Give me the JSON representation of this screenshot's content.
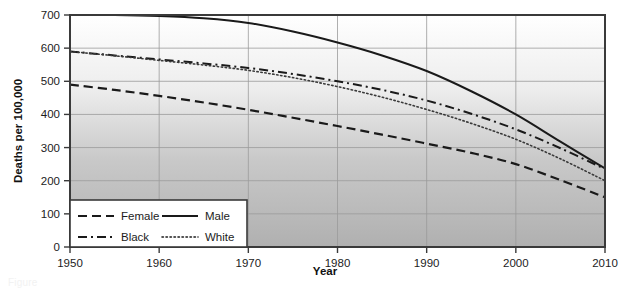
{
  "figure": {
    "caption_fragment": "Figure"
  },
  "axes": {
    "x_title": "Year",
    "y_title": "Deaths per 100,000",
    "x_ticks": [
      "1950",
      "1960",
      "1970",
      "1980",
      "1990",
      "2000",
      "2010"
    ],
    "y_ticks": [
      "0",
      "100",
      "200",
      "300",
      "400",
      "500",
      "600",
      "700"
    ]
  },
  "legend": {
    "entries": [
      {
        "label": "Female",
        "style": "dashed"
      },
      {
        "label": "Male",
        "style": "solid"
      },
      {
        "label": "Black",
        "style": "dash-dot"
      },
      {
        "label": "White",
        "style": "dotted"
      }
    ]
  },
  "chart_data": {
    "type": "line",
    "title": "",
    "subtitle": "",
    "xlabel": "Year",
    "ylabel": "Deaths per 100,000",
    "xlim": [
      1950,
      2010
    ],
    "ylim": [
      0,
      700
    ],
    "xticks": [
      1950,
      1960,
      1970,
      1980,
      1990,
      2000,
      2010
    ],
    "yticks": [
      0,
      100,
      200,
      300,
      400,
      500,
      600,
      700
    ],
    "grid": true,
    "legend_position": "bottom-left-inside",
    "x": [
      1950,
      1955,
      1960,
      1965,
      1970,
      1975,
      1980,
      1985,
      1990,
      1995,
      2000,
      2005,
      2010
    ],
    "series": [
      {
        "name": "Male",
        "style": "solid",
        "color": "#1a1a1a",
        "values": [
          700,
          700,
          697,
          690,
          676,
          650,
          617,
          578,
          531,
          470,
          400,
          318,
          237
        ]
      },
      {
        "name": "Black",
        "style": "dash-dot",
        "color": "#1a1a1a",
        "values": [
          590,
          578,
          566,
          554,
          540,
          522,
          500,
          474,
          442,
          402,
          355,
          298,
          235
        ]
      },
      {
        "name": "White",
        "style": "dotted",
        "color": "#3a3a3a",
        "values": [
          590,
          577,
          563,
          549,
          533,
          511,
          484,
          452,
          415,
          373,
          325,
          266,
          200
        ]
      },
      {
        "name": "Female",
        "style": "dashed",
        "color": "#1a1a1a",
        "values": [
          490,
          474,
          456,
          436,
          414,
          390,
          365,
          339,
          312,
          284,
          250,
          202,
          150
        ]
      }
    ]
  },
  "colors": {
    "plot_top": "#fdfdfd",
    "plot_bottom": "#b4b4b4",
    "frame": "#3a3a3a",
    "grid": "#9a9a9a",
    "line": "#1a1a1a",
    "legend_bg": "#ffffff"
  }
}
